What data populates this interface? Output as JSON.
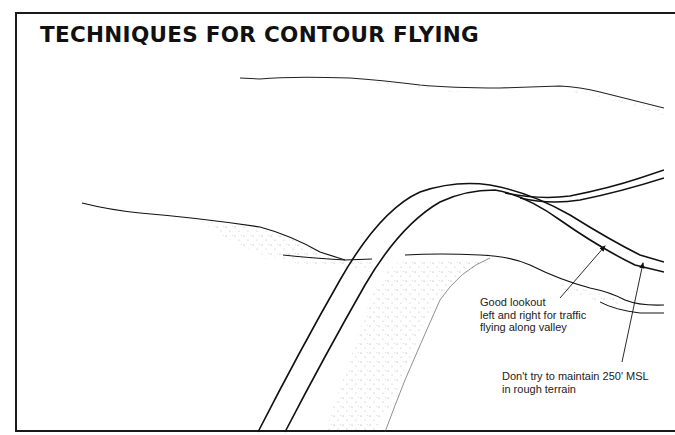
{
  "title": "TECHNIQUES FOR CONTOUR FLYING",
  "annotations": [
    {
      "id": "lookout",
      "lines": [
        "Good lookout",
        "left and right for traffic",
        "flying along valley"
      ]
    },
    {
      "id": "msl",
      "lines": [
        "Don't try to maintain 250' MSL",
        "in rough terrain"
      ]
    }
  ],
  "colors": {
    "ink": "#111111",
    "stipple": "#8a8a8a",
    "background": "#ffffff"
  }
}
